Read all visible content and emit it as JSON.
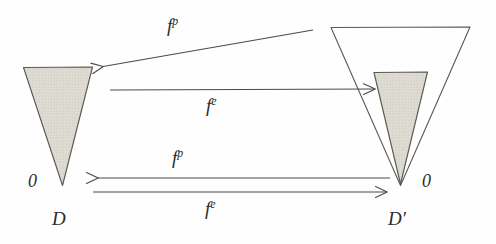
{
  "figure": {
    "type": "commutative-diagram",
    "background_color": "#fefefe",
    "stroke_color": "#4a4a46",
    "fill_color": "#dcdcd4"
  },
  "shapes": {
    "left_cone": {
      "name": "D",
      "filled": true,
      "fill": "#dcdcd4",
      "stroke": "#5a5a52"
    },
    "right_outer_cone": {
      "name": "D-prime-outer",
      "filled": false,
      "stroke": "#5a5a52"
    },
    "right_inner_cone": {
      "name": "D-prime-inner",
      "filled": true,
      "fill": "#dcdcd4",
      "stroke": "#5a5a52"
    }
  },
  "arrows": [
    {
      "id": "top-diagonal",
      "label": "f",
      "superscript": "p",
      "direction": "right-to-left",
      "label_text": "f p"
    },
    {
      "id": "upper-horizontal",
      "label": "f",
      "superscript": "e",
      "direction": "left-to-right",
      "label_text": "f e"
    },
    {
      "id": "lower-horizontal-top",
      "label": "f",
      "superscript": "p",
      "direction": "right-to-left",
      "label_text": "f p"
    },
    {
      "id": "lower-horizontal-bottom",
      "label": "f",
      "superscript": "e",
      "direction": "left-to-right",
      "label_text": "f e"
    }
  ],
  "labels": {
    "left_zero": "0",
    "left_domain": "D",
    "right_zero": "0",
    "right_domain": "D′",
    "map_fp_top": "f",
    "map_fp_top_sup": "p",
    "map_fe_upper": "f",
    "map_fe_upper_sup": "e",
    "map_fp_lower": "f",
    "map_fp_lower_sup": "p",
    "map_fe_lower": "f",
    "map_fe_lower_sup": "e"
  }
}
